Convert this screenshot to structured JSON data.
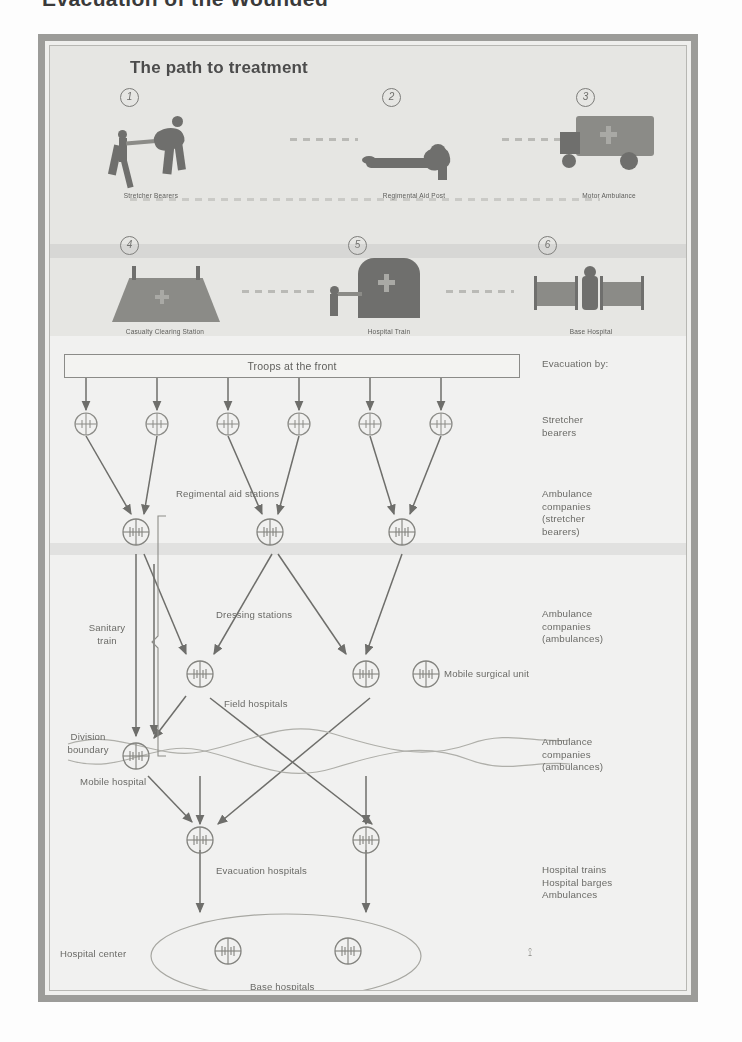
{
  "page": {
    "title": "Evacuation of the Wounded"
  },
  "photo_panel": {
    "heading": "The path to treatment",
    "steps": [
      {
        "number": "1",
        "caption": "Stretcher Bearers"
      },
      {
        "number": "2",
        "caption": "Regimental Aid Post"
      },
      {
        "number": "3",
        "caption": "Motor Ambulance"
      },
      {
        "number": "4",
        "caption": "Casualty Clearing Station"
      },
      {
        "number": "5",
        "caption": "Hospital Train"
      },
      {
        "number": "6",
        "caption": "Base Hospital"
      }
    ]
  },
  "diagram": {
    "title": "Troops at the front",
    "evacuation_header": "Evacuation by:",
    "node_labels": {
      "regimental_aid_stations": "Regimental aid stations",
      "dressing_stations": "Dressing stations",
      "field_hospitals": "Field hospitals",
      "mobile_surgical_unit": "Mobile surgical unit",
      "mobile_hospital": "Mobile hospital",
      "evacuation_hospitals": "Evacuation hospitals",
      "base_hospitals": "Base hospitals",
      "sanitary_train": "Sanitary\ntrain",
      "division_boundary": "Division\nboundary",
      "hospital_center": "Hospital center"
    },
    "right_column": [
      {
        "text": "Evacuation by:"
      },
      {
        "text": "Stretcher\nbearers"
      },
      {
        "text": "Ambulance\ncompanies\n(stretcher\nbearers)"
      },
      {
        "text": "Ambulance\ncompanies\n(ambulances)"
      },
      {
        "text": "Ambulance\ncompanies\n(ambulances)"
      },
      {
        "text": "Hospital trains\nHospital barges\nAmbulances"
      }
    ],
    "colors": {
      "ink": "#6a6a67",
      "line": "#7e7e7b",
      "frame": "#9d9d9a",
      "panel_bg": "#e9e9e6",
      "page_bg": "#f5f5f3"
    }
  }
}
